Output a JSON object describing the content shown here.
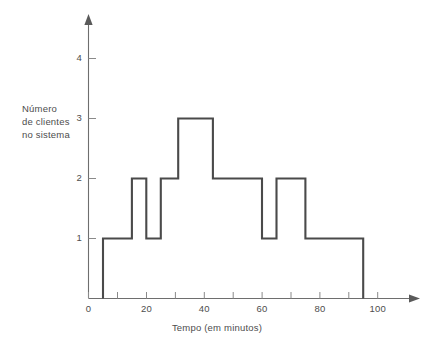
{
  "chart_data": {
    "type": "line",
    "subtype": "step-post",
    "title": "",
    "xlabel": "Tempo (em minutos)",
    "ylabel": "Número de clientes no sistema",
    "ylabel_lines": [
      "Número",
      "de clientes",
      "no sistema"
    ],
    "xlim": [
      0,
      108
    ],
    "ylim": [
      0,
      4.6
    ],
    "x_tick_values": [
      0,
      10,
      20,
      30,
      40,
      50,
      60,
      70,
      80,
      90,
      100
    ],
    "x_tick_labels": [
      "0",
      "",
      "20",
      "",
      "40",
      "",
      "60",
      "",
      "80",
      "",
      "100"
    ],
    "x_labeled_ticks": [
      {
        "value": 0,
        "label": "0"
      },
      {
        "value": 20,
        "label": "20"
      },
      {
        "value": 40,
        "label": "40"
      },
      {
        "value": 60,
        "label": "60"
      },
      {
        "value": 80,
        "label": "80"
      },
      {
        "value": 100,
        "label": "100"
      }
    ],
    "y_tick_values": [
      1,
      2,
      3,
      4
    ],
    "y_tick_labels": [
      "1",
      "2",
      "3",
      "4"
    ],
    "grid": false,
    "legend": false,
    "line_color": "#4a4a4a",
    "axis_color": "#6e6e6e",
    "background_color": "#ffffff",
    "x": [
      0,
      5,
      15,
      16,
      20,
      22,
      25,
      31,
      43,
      60,
      65,
      68,
      75,
      95,
      95
    ],
    "y": [
      0,
      1,
      1,
      2,
      2,
      1,
      1,
      2,
      3,
      2,
      2,
      1,
      1,
      2,
      2
    ],
    "steps": [
      {
        "from": 0,
        "to": 5,
        "value": 0
      },
      {
        "from": 5,
        "to": 15,
        "value": 1
      },
      {
        "from": 15,
        "to": 20,
        "value": 2
      },
      {
        "from": 20,
        "to": 25,
        "value": 1
      },
      {
        "from": 25,
        "to": 31,
        "value": 2
      },
      {
        "from": 31,
        "to": 43,
        "value": 3
      },
      {
        "from": 43,
        "to": 60,
        "value": 2
      },
      {
        "from": 60,
        "to": 65,
        "value": 1
      },
      {
        "from": 65,
        "to": 75,
        "value": 2
      },
      {
        "from": 75,
        "to": 95,
        "value": 1
      },
      {
        "from": 95,
        "to": 95,
        "value": 0
      }
    ],
    "annotations": []
  }
}
